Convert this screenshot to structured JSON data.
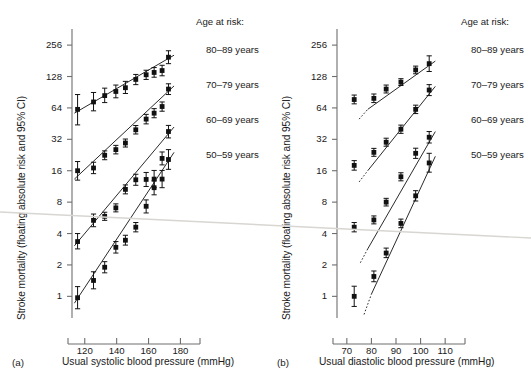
{
  "figure": {
    "artifact_color": "#d8d6d2",
    "marker_color": "#111111",
    "line_color": "#2b2b2b",
    "axis_color": "#6e6e6e"
  },
  "chart_data": [
    {
      "type": "scatter",
      "panel_tag": "(a)",
      "title": "",
      "xlabel": "Usual systolic blood pressure (mmHg)",
      "ylabel": "Stroke mortality (floating absolute risk and 95% CI)",
      "xlim": [
        112,
        186
      ],
      "ylim": [
        0.62,
        320
      ],
      "yscale": "log2",
      "xticks": [
        120,
        140,
        160,
        180
      ],
      "yticks": [
        1,
        2,
        4,
        8,
        16,
        32,
        64,
        128,
        256
      ],
      "grid": false,
      "legend_title": "Age at risk:",
      "legend_position": "right",
      "series": [
        {
          "name": "80–89 years",
          "x": [
            115.5,
            125.5,
            132.5,
            139.5,
            145.5,
            152,
            158.5,
            163.5,
            168.5,
            172.5
          ],
          "y": [
            62,
            73,
            84,
            92,
            100,
            120,
            133,
            140,
            146,
            196
          ],
          "ci_low": [
            44,
            60,
            72,
            80,
            88,
            107,
            120,
            126,
            130,
            170
          ],
          "ci_high": [
            86,
            90,
            99,
            106,
            115,
            134,
            147,
            156,
            164,
            226
          ],
          "fit": {
            "x0": 113.5,
            "y0": 57,
            "x1": 176,
            "y1": 205,
            "dotted_below": false
          }
        },
        {
          "name": "70–79 years",
          "x": [
            115.5,
            125.5,
            132.5,
            139.5,
            145.5,
            152,
            158.5,
            163.5,
            168.5,
            172.5
          ],
          "y": [
            16.0,
            17.0,
            22.5,
            25.5,
            29.5,
            39.5,
            50.0,
            57.0,
            66.0,
            97.0
          ],
          "ci_low": [
            13.0,
            15.0,
            20.4,
            23.2,
            27.0,
            36.0,
            45.0,
            51.5,
            59.5,
            86.0
          ],
          "ci_high": [
            19.6,
            19.3,
            24.8,
            28.0,
            32.2,
            43.4,
            55.5,
            63.0,
            73.0,
            109.0
          ],
          "fit": {
            "x0": 113.5,
            "y0": 13.3,
            "x1": 176,
            "y1": 104,
            "dotted_below": false
          }
        },
        {
          "name": "60–69 years",
          "x": [
            115.5,
            125.5,
            132.5,
            139.5,
            145.5,
            152,
            158.5,
            163.5,
            168.5,
            172.5
          ],
          "y": [
            3.35,
            5.35,
            5.85,
            7.05,
            10.6,
            13.1,
            13.2,
            13.3,
            21.0,
            38.0
          ],
          "ci_low": [
            2.85,
            4.65,
            5.35,
            6.45,
            9.6,
            11.6,
            11.3,
            11.0,
            18.2,
            33.0
          ],
          "ci_high": [
            4.0,
            6.15,
            6.4,
            7.7,
            11.7,
            14.8,
            15.4,
            16.1,
            24.2,
            43.5
          ],
          "fit": {
            "x0": 113.5,
            "y0": 3.05,
            "x1": 176,
            "y1": 42.0,
            "dotted_below": false
          }
        },
        {
          "name": "50–59 years",
          "x": [
            115.5,
            125.5,
            132.5,
            139.5,
            145.5,
            152,
            158.5,
            163.5,
            168.5,
            172.5
          ],
          "y": [
            0.97,
            1.42,
            1.9,
            2.95,
            3.45,
            4.6,
            7.3,
            11.0,
            13.3,
            20.5
          ],
          "ci_low": [
            0.76,
            1.18,
            1.68,
            2.6,
            3.1,
            4.15,
            6.3,
            9.4,
            11.0,
            16.5
          ],
          "ci_high": [
            1.24,
            1.72,
            2.15,
            3.35,
            3.85,
            5.1,
            8.4,
            12.8,
            16.1,
            25.5
          ],
          "fit": {
            "x0": 113.5,
            "y0": 0.86,
            "x1": 176,
            "y1": 24.0,
            "dotted_below": false
          }
        }
      ]
    },
    {
      "type": "scatter",
      "panel_tag": "(b)",
      "title": "",
      "xlabel": "Usual diastolic blood pressure (mmHg)",
      "ylabel": "Stroke mortality (floating absolute risk and 95% CI)",
      "xlim": [
        66,
        114
      ],
      "ylim": [
        0.62,
        320
      ],
      "yscale": "log2",
      "xticks": [
        70,
        80,
        90,
        100,
        110
      ],
      "yticks": [
        1,
        2,
        4,
        8,
        16,
        32,
        64,
        128,
        256
      ],
      "grid": false,
      "legend_title": "Age at risk:",
      "legend_position": "right",
      "series": [
        {
          "name": "80–89 years",
          "x": [
            73.0,
            81.0,
            86.0,
            92.0,
            98.0,
            103.5
          ],
          "y": [
            77.0,
            79.0,
            97.0,
            113.0,
            148.0,
            170.0
          ],
          "ci_low": [
            70.0,
            72.0,
            89.0,
            105.0,
            136.0,
            143.0
          ],
          "ci_high": [
            85.0,
            87.0,
            106.0,
            122.0,
            161.0,
            202.0
          ],
          "fit": {
            "x0": 78.5,
            "y0": 62.0,
            "x1": 106.0,
            "y1": 180.0,
            "dotted_below": true,
            "dot_x": 75.0,
            "dot_y": 50.0
          }
        },
        {
          "name": "70–79 years",
          "x": [
            73.0,
            81.0,
            86.0,
            92.0,
            98.0,
            103.5
          ],
          "y": [
            18.0,
            24.0,
            30.0,
            40.0,
            62.0,
            95.0
          ],
          "ci_low": [
            16.2,
            22.0,
            27.5,
            36.5,
            56.5,
            84.0
          ],
          "ci_high": [
            20.0,
            26.2,
            32.8,
            43.8,
            68.0,
            107.0
          ],
          "fit": {
            "x0": 78.5,
            "y0": 16.0,
            "x1": 106.0,
            "y1": 103.0,
            "dotted_below": true,
            "dot_x": 75.0,
            "dot_y": 12.5
          }
        },
        {
          "name": "60–69 years",
          "x": [
            73.0,
            81.0,
            86.0,
            92.0,
            98.0,
            103.5
          ],
          "y": [
            4.6,
            5.4,
            8.0,
            14.0,
            23.5,
            33.5
          ],
          "ci_low": [
            4.15,
            4.95,
            7.35,
            12.8,
            21.0,
            29.5
          ],
          "ci_high": [
            5.1,
            5.9,
            8.7,
            15.3,
            26.3,
            38.0
          ],
          "fit": {
            "x0": 78.5,
            "y0": 2.85,
            "x1": 106.0,
            "y1": 38.0,
            "dotted_below": true,
            "dot_x": 75.5,
            "dot_y": 2.1
          }
        },
        {
          "name": "50–59 years",
          "x": [
            73.0,
            81.0,
            86.0,
            92.0,
            98.0,
            103.5
          ],
          "y": [
            1.0,
            1.55,
            2.6,
            5.0,
            9.2,
            19.0
          ],
          "ci_low": [
            0.8,
            1.38,
            2.35,
            4.55,
            8.2,
            15.5
          ],
          "ci_high": [
            1.25,
            1.75,
            2.9,
            5.5,
            10.3,
            23.5
          ],
          "fit": {
            "x0": 80.0,
            "y0": 1.05,
            "x1": 106.0,
            "y1": 22.0,
            "dotted_below": true,
            "dot_x": 77.0,
            "dot_y": 0.67
          }
        }
      ]
    }
  ]
}
